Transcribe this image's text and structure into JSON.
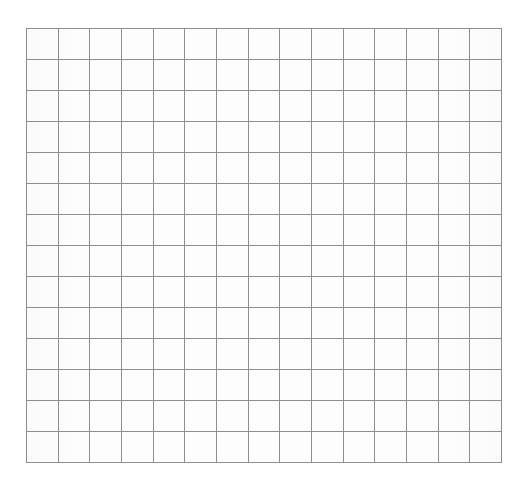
{
  "page": {
    "background_color": "#ffffff"
  },
  "grid": {
    "name": "grid-paper",
    "columns": 15,
    "rows": 14,
    "cell_width_px": 31.7,
    "cell_height_px": 31.1,
    "line_color": "#8f8f8f",
    "line_width_px": 1,
    "cell_fill_color": "#fdfdfd",
    "origin_x_px": 26,
    "origin_y_px": 28,
    "width_px": 476,
    "height_px": 435,
    "cells": []
  },
  "chart_data": {
    "type": "table",
    "title": "",
    "xlabel": "",
    "ylabel": "",
    "categories": [],
    "values": [],
    "grid": true,
    "legend": "none",
    "columns": 15,
    "rows": 14,
    "note": "Empty grid / graph paper; all 210 cells are blank with no plotted data, labels, or tick marks."
  }
}
